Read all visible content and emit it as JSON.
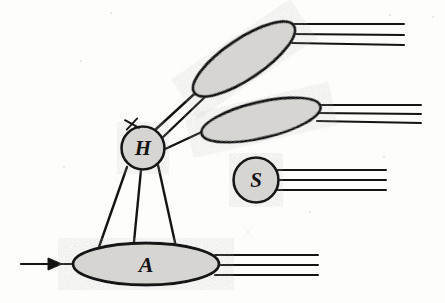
{
  "figure": {
    "kind": "qcd-factorization-diagram",
    "background_color": "#fdfdfb",
    "ink_color": "#161412",
    "blob_fill_color": "#d6d5d2",
    "width": 445,
    "height": 303
  },
  "blobs": {
    "hard": {
      "label": "H",
      "name": "hard-scattering-blob",
      "shape": "circle",
      "cx": 143,
      "cy": 148,
      "r": 21.5,
      "font_size": 21
    },
    "soft": {
      "label": "S",
      "name": "soft-blob",
      "shape": "circle",
      "cx": 256,
      "cy": 180,
      "r": 22.5,
      "font_size": 21
    },
    "target": {
      "label": "A",
      "name": "target-blob",
      "shape": "ellipse",
      "cx": 146,
      "cy": 264,
      "rx": 73,
      "ry": 21,
      "rotation": 0,
      "font_size": 22
    },
    "jet_upper": {
      "label": "",
      "name": "upper-jet-blob",
      "shape": "ellipse",
      "cx": 244,
      "cy": 59,
      "rx": 60,
      "ry": 20,
      "rotation": -34
    },
    "jet_middle": {
      "label": "",
      "name": "middle-jet-blob",
      "shape": "ellipse",
      "cx": 261,
      "cy": 120,
      "rx": 61,
      "ry": 18,
      "rotation": -13
    }
  },
  "lines": {
    "incoming_beam": {
      "name": "incoming-beam-line",
      "x1": 21,
      "y1": 264,
      "x2": 74,
      "y2": 264,
      "arrow_at": 52
    },
    "hard_to_target_legs": [
      {
        "name": "hard-to-target-leg-left",
        "x1": 127,
        "y1": 167,
        "x2": 99,
        "y2": 247
      },
      {
        "name": "hard-to-target-leg-middle",
        "x1": 141,
        "y1": 170,
        "x2": 133,
        "y2": 252
      },
      {
        "name": "hard-to-target-leg-right",
        "x1": 158,
        "y1": 165,
        "x2": 176,
        "y2": 247
      }
    ],
    "hard_to_upper_jet": [
      {
        "name": "hard-to-upper-jet-line-upper",
        "x1": 155,
        "y1": 130,
        "x2": 203,
        "y2": 86
      },
      {
        "name": "hard-to-upper-jet-line-lower",
        "x1": 160,
        "y1": 140,
        "x2": 207,
        "y2": 95
      }
    ],
    "hard_to_middle_jet": {
      "name": "hard-to-middle-jet-line",
      "x1": 163,
      "y1": 150,
      "x2": 206,
      "y2": 130
    },
    "upper_jet_outgoing": {
      "name": "upper-jet-outgoing-lines",
      "count": 3,
      "x_start": 292,
      "x_end": 404,
      "ys": [
        24,
        34,
        43
      ],
      "y_end_offsets": [
        0,
        1,
        2
      ]
    },
    "middle_jet_outgoing": {
      "name": "middle-jet-outgoing-lines",
      "count": 3,
      "x_start": 317,
      "x_end": 421,
      "ys": [
        105,
        113,
        121
      ],
      "y_end_offsets": [
        0,
        1,
        2
      ]
    },
    "soft_outgoing": {
      "name": "soft-outgoing-lines",
      "count": 3,
      "x_start": 277,
      "x_end": 386,
      "ys": [
        170,
        180,
        190
      ],
      "y_end_offsets": [
        0,
        0,
        0
      ]
    },
    "target_outgoing": {
      "name": "target-outgoing-lines",
      "count": 3,
      "x_start": 215,
      "x_end": 318,
      "ys": [
        255,
        265,
        275
      ],
      "y_end_offsets": [
        0,
        0,
        0
      ]
    }
  },
  "markers": {
    "hard_vertex_cross": {
      "name": "hard-vertex-cross-marker",
      "cx": 132,
      "cy": 124,
      "size": 7,
      "description": "small x mark on upper-left rim of H blob"
    },
    "beam_arrowhead": {
      "name": "beam-arrowhead",
      "tip_x": 62,
      "tip_y": 264,
      "length": 14,
      "half_width": 6
    }
  },
  "specks": [
    {
      "x": 110,
      "y": 12,
      "d": 2
    },
    {
      "x": 389,
      "y": 14,
      "d": 2
    },
    {
      "x": 432,
      "y": 16,
      "d": 2
    },
    {
      "x": 63,
      "y": 166,
      "d": 2
    },
    {
      "x": 383,
      "y": 156,
      "d": 2
    },
    {
      "x": 247,
      "y": 231,
      "d": 2
    },
    {
      "x": 80,
      "y": 60,
      "d": 2
    },
    {
      "x": 309,
      "y": 211,
      "d": 2
    }
  ]
}
